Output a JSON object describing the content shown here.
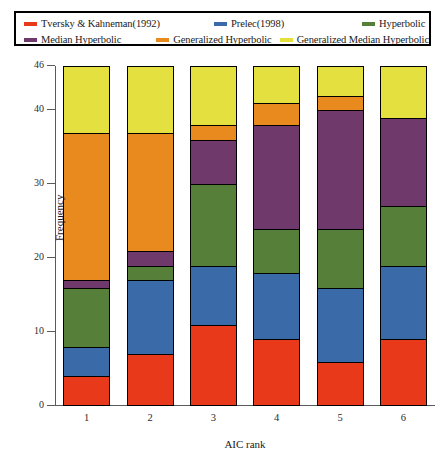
{
  "chart_data": {
    "type": "bar",
    "stacked": true,
    "title": "",
    "xlabel": "AIC rank",
    "ylabel": "Frequency",
    "categories": [
      "1",
      "2",
      "3",
      "4",
      "5",
      "6"
    ],
    "ylim": [
      0,
      46
    ],
    "yticks": [
      0,
      10,
      20,
      30,
      40,
      46
    ],
    "ytick_labels": [
      "0",
      "10",
      "20",
      "30",
      "40",
      "46"
    ],
    "grid": false,
    "legend_position": "top",
    "series": [
      {
        "name": "Tversky & Kahneman(1992)",
        "color": "#e8391b",
        "values": [
          4,
          7,
          11,
          9,
          6,
          9
        ]
      },
      {
        "name": "Prelec(1998)",
        "color": "#3b6aa8",
        "values": [
          4,
          10,
          8,
          9,
          10,
          10
        ]
      },
      {
        "name": "Hyperbolic",
        "color": "#568039",
        "values": [
          8,
          2,
          11,
          6,
          8,
          8
        ]
      },
      {
        "name": "Median Hyperbolic",
        "color": "#6f3a6b",
        "values": [
          1,
          2,
          6,
          14,
          16,
          12
        ]
      },
      {
        "name": "Generalized Hyperbolic",
        "color": "#e88a1e",
        "values": [
          20,
          16,
          2,
          3,
          2,
          0
        ]
      },
      {
        "name": "Generalized Median Hyperbolic",
        "color": "#e3e03f",
        "values": [
          9,
          9,
          8,
          5,
          4,
          7
        ]
      }
    ]
  },
  "legend": {
    "items": [
      {
        "label": "Tversky & Kahneman(1992)",
        "color": "#e8391b"
      },
      {
        "label": "Prelec(1998)",
        "color": "#3b6aa8"
      },
      {
        "label": "Hyperbolic",
        "color": "#568039"
      },
      {
        "label": "Median Hyperbolic",
        "color": "#6f3a6b"
      },
      {
        "label": "Generalized Hyperbolic",
        "color": "#e88a1e"
      },
      {
        "label": "Generalized Median Hyperbolic",
        "color": "#e3e03f"
      }
    ]
  }
}
